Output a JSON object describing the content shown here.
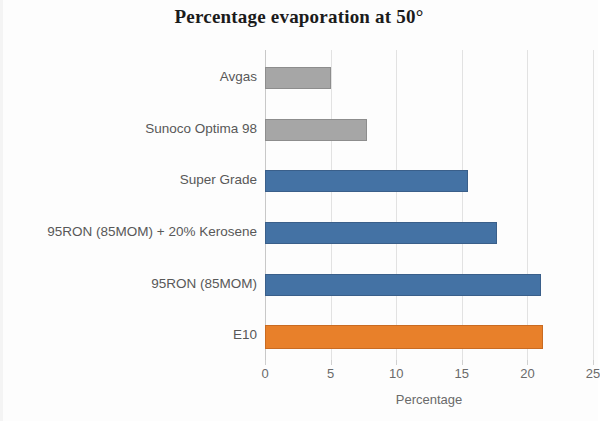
{
  "chart_data": {
    "type": "bar",
    "orientation": "horizontal",
    "title": "Percentage evaporation at 50°",
    "subtitle": "",
    "xlabel": "Percentage",
    "ylabel": "",
    "xlim": [
      0,
      25
    ],
    "xticks": [
      0,
      5,
      10,
      15,
      20,
      25
    ],
    "xtick_labels": [
      "0",
      "5",
      "10",
      "15",
      "20",
      "25"
    ],
    "grid": true,
    "gridlines": "vertical",
    "legend": "none",
    "categories": [
      "Avgas",
      "Sunoco Optima 98",
      "Super Grade",
      "95RON (85MOM) + 20% Kerosene",
      "95RON (85MOM)",
      "E10"
    ],
    "values": [
      5.0,
      7.8,
      15.5,
      17.7,
      21.0,
      21.2
    ],
    "bar_colors": [
      "#a6a6a6",
      "#a6a6a6",
      "#4472a4",
      "#4472a4",
      "#4472a4",
      "#e8802a"
    ],
    "colors": {
      "gray": "#a6a6a6",
      "blue": "#4472a4",
      "orange": "#e8802a",
      "gridline": "#e2e2e2",
      "axis": "#c8c8c8",
      "label_text": "#585858",
      "title_text": "#1b1b1b"
    },
    "bars": [
      {
        "category": "Avgas",
        "value": 5.0,
        "color_name": "gray",
        "color": "#a6a6a6"
      },
      {
        "category": "Sunoco Optima 98",
        "value": 7.8,
        "color_name": "gray",
        "color": "#a6a6a6"
      },
      {
        "category": "Super Grade",
        "value": 15.5,
        "color_name": "blue",
        "color": "#4472a4"
      },
      {
        "category": "95RON (85MOM) + 20% Kerosene",
        "value": 17.7,
        "color_name": "blue",
        "color": "#4472a4"
      },
      {
        "category": "95RON (85MOM)",
        "value": 21.0,
        "color_name": "blue",
        "color": "#4472a4"
      },
      {
        "category": "E10",
        "value": 21.2,
        "color_name": "orange",
        "color": "#e8802a"
      }
    ]
  }
}
